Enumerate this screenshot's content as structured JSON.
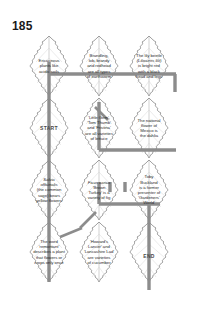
{
  "page": {
    "number": "185"
  },
  "puzzle": {
    "type": "leaf-maze-trivia",
    "grid": {
      "columns": 3,
      "rows": 4
    },
    "start_label": "START",
    "end_label": "END",
    "cells": [
      {
        "position": "row1-col1",
        "lines": [
          "Ericaceous",
          "plants like",
          "acidic soils"
        ]
      },
      {
        "position": "row1-col2",
        "lines": [
          "Brandling,",
          "lob, brandy",
          "and redhead",
          "are all types",
          "of earthworm"
        ]
      },
      {
        "position": "row1-col3",
        "lines": [
          "The lily beetle",
          "(Lilioceris lilii)",
          "is bright red",
          "with a black",
          "head and legs"
        ]
      },
      {
        "position": "row2-col1",
        "lines": [],
        "marker": "START"
      },
      {
        "position": "row2-col2",
        "lines": [
          "'Little Gem',",
          "'Tom Thumb'",
          "and 'Fristina'",
          "are all varieties",
          "of lettuce"
        ]
      },
      {
        "position": "row2-col3",
        "lines": [
          "The national",
          "flower of",
          "Mexico is",
          "the dahlia"
        ]
      },
      {
        "position": "row3-col1",
        "lines": [
          "Salvia",
          "officinalis",
          "(the common",
          "sage) bears",
          "yellow flowers"
        ]
      },
      {
        "position": "row3-col2",
        "lines": [
          "Ficus carica",
          "'Brown",
          "Turkey' is a",
          "variety of fig"
        ]
      },
      {
        "position": "row3-col3",
        "lines": [
          "Toby",
          "Buckland",
          "is a former",
          "presenter of",
          "'Gardeners'",
          "World'"
        ]
      },
      {
        "position": "row4-col1",
        "lines": [
          "The word",
          "'remontant'",
          "describes a plant",
          "that flowers or",
          "crops only once"
        ]
      },
      {
        "position": "row4-col2",
        "lines": [
          "'Howard's",
          "Lancer' and",
          "'Lancashire Lad'",
          "are varieties",
          "of cucumber"
        ]
      },
      {
        "position": "row4-col3",
        "lines": [],
        "marker": "END"
      }
    ]
  },
  "style": {
    "leaf_outline_color": "#4d4d4d",
    "vein_color": "#bdbdbd",
    "path_color": "#8c8c8c",
    "text_color": "#2b2b2b"
  }
}
